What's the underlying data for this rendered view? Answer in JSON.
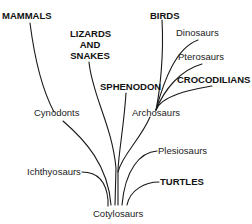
{
  "diagram": {
    "type": "phylogenetic-tree",
    "root": "Cotylosaurs",
    "labels": {
      "mammals": "MAMMALS",
      "lizards_and_snakes": [
        "LIZARDS",
        "AND",
        "SNAKES"
      ],
      "birds": "BIRDS",
      "dinosaurs": "Dinosaurs",
      "pterosaurs": "Pterosaurs",
      "crocodilians": "CROCODILIANS",
      "sphenodon": "SPHENODON",
      "cynodonts": "Cynodonts",
      "archosaurs": "Archosaurs",
      "plesiosaurs": "Plesiosaurs",
      "ichthyosaurs": "Ichthyosaurs",
      "turtles": "TURTLES",
      "cotylosaurs": "Cotylosaurs"
    },
    "edges": [
      [
        "Cotylosaurs",
        "Ichthyosaurs"
      ],
      [
        "Cotylosaurs",
        "Cynodonts"
      ],
      [
        "Cynodonts",
        "MAMMALS"
      ],
      [
        "Cotylosaurs",
        "LIZARDS AND SNAKES"
      ],
      [
        "Cotylosaurs",
        "SPHENODON"
      ],
      [
        "Cotylosaurs",
        "Archosaurs"
      ],
      [
        "Archosaurs",
        "BIRDS"
      ],
      [
        "Archosaurs",
        "Dinosaurs"
      ],
      [
        "Archosaurs",
        "Pterosaurs"
      ],
      [
        "Archosaurs",
        "CROCODILIANS"
      ],
      [
        "Cotylosaurs",
        "Plesiosaurs"
      ],
      [
        "Cotylosaurs",
        "TURTLES"
      ]
    ]
  }
}
